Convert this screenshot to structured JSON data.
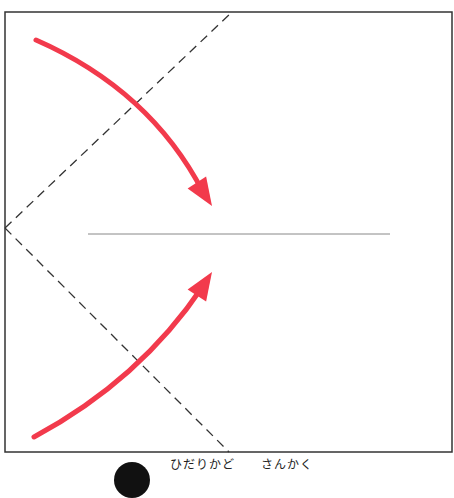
{
  "diagram": {
    "type": "origami-fold-step",
    "paper": {
      "x": 5,
      "y": 12,
      "width": 447,
      "height": 440,
      "border_color": "#333333",
      "fill": "#ffffff"
    },
    "center_crease": {
      "x1": 88,
      "y1": 234,
      "x2": 390,
      "y2": 234,
      "color": "#888888"
    },
    "fold_lines": [
      {
        "name": "upper-valley-fold",
        "x1": 5,
        "y1": 228,
        "x2": 232,
        "y2": 12,
        "style": "dashed"
      },
      {
        "name": "lower-valley-fold",
        "x1": 5,
        "y1": 228,
        "x2": 229,
        "y2": 452,
        "style": "dashed"
      }
    ],
    "arrows": [
      {
        "name": "fold-arrow-top",
        "path": "M36,40 Q150,90 203,192",
        "tip": [
          212,
          206
        ],
        "color": "#f23a4c"
      },
      {
        "name": "fold-arrow-bottom",
        "path": "M34,437 Q140,380 203,286",
        "tip": [
          212,
          272
        ],
        "color": "#f23a4c"
      }
    ],
    "accent_color": "#f23a4c"
  },
  "caption": {
    "step_number": "",
    "text": "ひだりかど　　さんかく"
  }
}
